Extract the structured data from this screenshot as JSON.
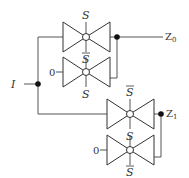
{
  "diagram": {
    "type": "demultiplexer-transmission-gates",
    "input": {
      "label": "I"
    },
    "outputs": [
      {
        "label": "Z",
        "subscript": "0"
      },
      {
        "label": "Z",
        "subscript": "1"
      }
    ],
    "gates": [
      {
        "id": "g1",
        "top_label": "S",
        "top_bar": false,
        "bottom_label": "S",
        "bottom_bar": true,
        "input": "I"
      },
      {
        "id": "g2",
        "top_label": "S",
        "top_bar": true,
        "bottom_label": "S",
        "bottom_bar": false,
        "input": "0"
      },
      {
        "id": "g3",
        "top_label": "S",
        "top_bar": true,
        "bottom_label": "S",
        "bottom_bar": false,
        "input": "I"
      },
      {
        "id": "g4",
        "top_label": "S",
        "top_bar": false,
        "bottom_label": "S",
        "bottom_bar": true,
        "input": "0"
      }
    ],
    "constants": [
      "0",
      "0"
    ],
    "colors": {
      "wire": "#555555",
      "gate": "#333333",
      "node": "#111111",
      "background": "#ffffff"
    }
  }
}
